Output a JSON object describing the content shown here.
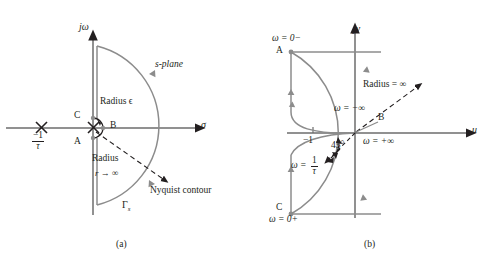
{
  "figure": {
    "panels": [
      {
        "id": "a",
        "caption": "(a)",
        "plane_label": "s-plane",
        "axes": {
          "vertical": "jω",
          "horizontal": "σ"
        },
        "pole_label_num": "−1",
        "pole_label_den": "τ",
        "points": {
          "a": "A",
          "b": "B",
          "c": "C"
        },
        "small_radius_label": "Radius ϵ",
        "big_radius_label_line1": "Radius",
        "big_radius_label_line2": "r → ∞",
        "contour_label": "Nyquist contour",
        "contour_symbol": "Γ",
        "contour_symbol_sub": "s"
      },
      {
        "id": "b",
        "caption": "(b)",
        "axes": {
          "vertical": "jv",
          "horizontal": "u"
        },
        "points": {
          "a": "A",
          "b": "B",
          "c": "C"
        },
        "omega_zero_minus": "ω = 0−",
        "omega_zero_plus": "ω = 0+",
        "omega_neg_inf": "ω = −∞",
        "omega_pos_inf": "ω = +∞",
        "omega_tau_prefix": "ω =",
        "omega_tau_num": "1",
        "omega_tau_den": "τ",
        "angle_label": "45°",
        "radius_label": "Radius = ∞",
        "tick_minus_one": "−1"
      }
    ]
  },
  "colors": {
    "curve": "#8c8c8c",
    "axis": "#6d6d6d",
    "ink": "#231f20",
    "dashed": "#3a3a3a"
  }
}
